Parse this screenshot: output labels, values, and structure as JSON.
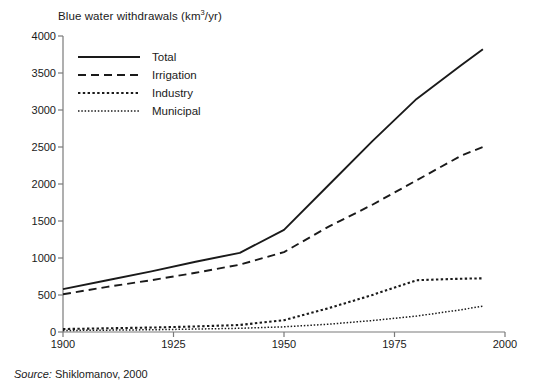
{
  "chart_data": {
    "type": "line",
    "title": "Blue water withdrawals (km3/yr)",
    "title_prefix": "Blue water withdrawals (km",
    "title_sup": "3",
    "title_suffix": "/yr)",
    "xlabel": "",
    "ylabel": "Blue water withdrawals (km3/yr)",
    "xlim": [
      1900,
      2000
    ],
    "ylim": [
      0,
      4000
    ],
    "grid": false,
    "legend_position": "top-left inside",
    "xticks": [
      1900,
      1925,
      1950,
      1975,
      2000
    ],
    "yticks": [
      0,
      500,
      1000,
      1500,
      2000,
      2500,
      3000,
      3500,
      4000
    ],
    "x": [
      1900,
      1910,
      1920,
      1930,
      1940,
      1950,
      1960,
      1970,
      1980,
      1990,
      1995
    ],
    "series": [
      {
        "name": "Total",
        "style": "solid",
        "color": "#1a1a1a",
        "values": [
          580,
          700,
          820,
          950,
          1070,
          1380,
          1980,
          2580,
          3150,
          3600,
          3820
        ]
      },
      {
        "name": "Irrigation",
        "style": "dashed",
        "color": "#1a1a1a",
        "values": [
          510,
          610,
          700,
          800,
          910,
          1080,
          1420,
          1720,
          2050,
          2380,
          2500
        ]
      },
      {
        "name": "Industry",
        "style": "dotted-coarse",
        "color": "#1a1a1a",
        "values": [
          40,
          50,
          60,
          75,
          95,
          160,
          320,
          500,
          700,
          720,
          725
        ]
      },
      {
        "name": "Municipal",
        "style": "dotted-fine",
        "color": "#1a1a1a",
        "values": [
          20,
          25,
          30,
          40,
          50,
          70,
          105,
          155,
          215,
          300,
          350
        ]
      }
    ],
    "source": "Source: Shiklomanov, 2000",
    "source_label": "Source:",
    "source_text": " Shiklomanov, 2000"
  },
  "axes": {
    "axis_color": "#7a7a7a"
  }
}
